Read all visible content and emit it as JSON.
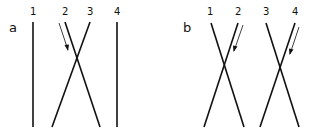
{
  "panels": [
    {
      "label": "a",
      "strand_labels": [
        "1",
        "2",
        "3",
        "4"
      ],
      "description": "Strands 2 and 3 cross; strands 1 and 4 straight; arrow along strand 2"
    },
    {
      "label": "b",
      "strand_labels": [
        "1",
        "2",
        "3",
        "4"
      ],
      "description": "Strands 1-2 cross and strands 3-4 cross; arrows along strands 2 and 4"
    }
  ],
  "colors": {
    "line": "#111111",
    "background": "#ffffff"
  }
}
